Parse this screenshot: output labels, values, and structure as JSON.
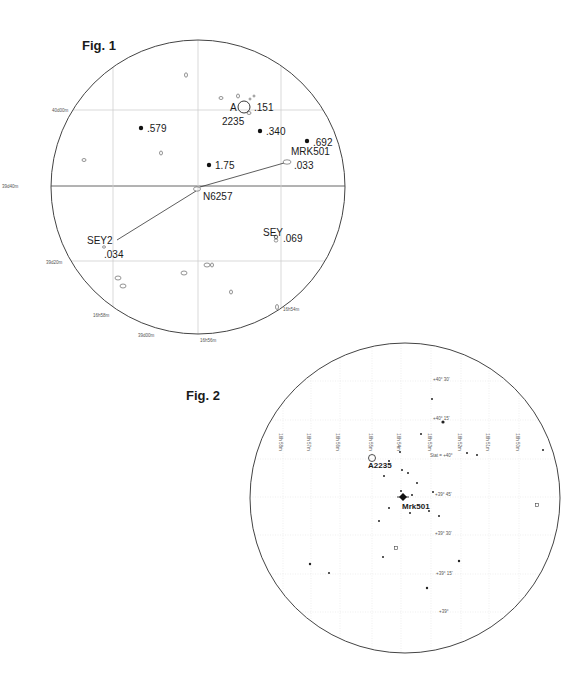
{
  "fig1": {
    "title": "Fig. 1",
    "circle": {
      "cx": 198,
      "cy": 187,
      "r": 147
    },
    "grid_h": [
      {
        "y": 110,
        "label": "40d00m",
        "lx": 52,
        "ly": 112
      },
      {
        "y": 186,
        "label": "39d40m",
        "lx": 2,
        "ly": 188
      },
      {
        "y": 261,
        "label": "39d20m",
        "lx": 46,
        "ly": 264
      }
    ],
    "grid_v": [
      {
        "x": 113,
        "label": "16h58m",
        "lx": 93,
        "ly": 317
      },
      {
        "x": 198,
        "label": "16h56m",
        "lx": 200,
        "ly": 342
      },
      {
        "x": 281,
        "label": "16h54m",
        "lx": 283,
        "ly": 311
      }
    ],
    "extra_axis_labels": [
      {
        "label": "39d00m",
        "x": 138,
        "y": 337
      }
    ],
    "filled_points": [
      {
        "x": 141,
        "y": 128,
        "label": ".579",
        "lx": 147,
        "ly": 132
      },
      {
        "x": 260,
        "y": 131,
        "label": ".340",
        "lx": 266,
        "ly": 135
      },
      {
        "x": 307,
        "y": 141,
        "label": ".692",
        "lx": 313,
        "ly": 146
      },
      {
        "x": 209,
        "y": 165,
        "label": "1.75",
        "lx": 215,
        "ly": 169
      }
    ],
    "open_objects": [
      {
        "x": 186,
        "y": 75,
        "rx": 1.5,
        "ry": 2.2
      },
      {
        "x": 221,
        "y": 98,
        "rx": 2,
        "ry": 1.5
      },
      {
        "x": 238,
        "y": 96,
        "rx": 1.5,
        "ry": 2
      },
      {
        "x": 250,
        "y": 99,
        "rx": 1,
        "ry": 1
      },
      {
        "x": 254,
        "y": 96,
        "rx": 1,
        "ry": 1
      },
      {
        "x": 249,
        "y": 113,
        "rx": 2,
        "ry": 1.5
      },
      {
        "x": 84,
        "y": 160,
        "rx": 2,
        "ry": 1.5
      },
      {
        "x": 161,
        "y": 153,
        "rx": 1.5,
        "ry": 2
      },
      {
        "x": 197,
        "y": 189,
        "rx": 3.5,
        "ry": 2.2
      },
      {
        "x": 287,
        "y": 162,
        "rx": 4,
        "ry": 2.2
      },
      {
        "x": 104,
        "y": 247,
        "rx": 1.5,
        "ry": 1.2
      },
      {
        "x": 276,
        "y": 237,
        "rx": 1.5,
        "ry": 2
      },
      {
        "x": 118,
        "y": 278,
        "rx": 3,
        "ry": 2
      },
      {
        "x": 123,
        "y": 286,
        "rx": 3,
        "ry": 2
      },
      {
        "x": 184,
        "y": 273,
        "rx": 3,
        "ry": 2
      },
      {
        "x": 207,
        "y": 265,
        "rx": 3,
        "ry": 2
      },
      {
        "x": 212,
        "y": 265,
        "rx": 1.5,
        "ry": 2
      },
      {
        "x": 231,
        "y": 292,
        "rx": 1.5,
        "ry": 2
      },
      {
        "x": 277,
        "y": 307,
        "rx": 1.5,
        "ry": 2.5
      }
    ],
    "cluster": {
      "x": 244,
      "y": 107,
      "r": 6,
      "label_top": "A",
      "label_bottom": "2235",
      "z": ".151"
    },
    "labels": [
      {
        "text": "A",
        "x": 230,
        "y": 111,
        "size": 10
      },
      {
        "text": "2235",
        "x": 222,
        "y": 125,
        "size": 10
      },
      {
        "text": ".151",
        "x": 254,
        "y": 111,
        "size": 10
      },
      {
        "text": "MRK501",
        "x": 291,
        "y": 155,
        "size": 10
      },
      {
        "text": ".033",
        "x": 294,
        "y": 169,
        "size": 10
      },
      {
        "text": "N6257",
        "x": 203,
        "y": 200,
        "size": 10
      },
      {
        "text": "SEY2",
        "x": 87,
        "y": 244,
        "size": 10
      },
      {
        "text": ".034",
        "x": 104,
        "y": 258,
        "size": 10
      },
      {
        "text": "SEY",
        "x": 263,
        "y": 236,
        "size": 10
      },
      {
        "text": ".069",
        "x": 283,
        "y": 242,
        "size": 10
      }
    ],
    "sey_marker": {
      "x": 276,
      "y": 239
    },
    "lines": [
      {
        "x1": 200,
        "y1": 187,
        "x2": 284,
        "y2": 163
      },
      {
        "x1": 196,
        "y1": 191,
        "x2": 117,
        "y2": 240
      }
    ]
  },
  "fig2": {
    "title": "Fig. 2",
    "circle": {
      "cx": 405,
      "cy": 498,
      "r": 155
    },
    "ra_labels": [
      {
        "text": "16h 58m",
        "x": 279
      },
      {
        "text": "16h 57m",
        "x": 307
      },
      {
        "text": "16h 56m",
        "x": 336
      },
      {
        "text": "16h 55m",
        "x": 369
      },
      {
        "text": "16h 54m",
        "x": 397
      },
      {
        "text": "16h 53m",
        "x": 428
      },
      {
        "text": "16h 52m",
        "x": 458
      },
      {
        "text": "16h 51m",
        "x": 486
      },
      {
        "text": "16h 50m",
        "x": 516
      }
    ],
    "ra_label_y": 442,
    "dec_labels": [
      {
        "text": "+40° 30'",
        "x": 433,
        "y": 381
      },
      {
        "text": "+40° 15'",
        "x": 433,
        "y": 420
      },
      {
        "text": "Stat = +40°",
        "x": 430,
        "y": 457
      },
      {
        "text": "+39° 45'",
        "x": 435,
        "y": 496
      },
      {
        "text": "+39° 30'",
        "x": 435,
        "y": 535
      },
      {
        "text": "+39° 15'",
        "x": 436,
        "y": 575
      },
      {
        "text": "+39°",
        "x": 439,
        "y": 613
      }
    ],
    "grid_h_y": [
      381,
      420,
      459,
      497,
      535,
      574,
      612
    ],
    "grid_v_x": [
      283,
      311,
      340,
      372,
      401,
      431,
      461,
      489,
      519
    ],
    "stars": [
      {
        "x": 432,
        "y": 399,
        "s": 1
      },
      {
        "x": 443,
        "y": 422,
        "s": 1.6
      },
      {
        "x": 421,
        "y": 434,
        "s": 1
      },
      {
        "x": 400,
        "y": 452,
        "s": 1
      },
      {
        "x": 467,
        "y": 453,
        "s": 1
      },
      {
        "x": 477,
        "y": 455,
        "s": 1
      },
      {
        "x": 389,
        "y": 461,
        "s": 1
      },
      {
        "x": 402,
        "y": 470,
        "s": 1
      },
      {
        "x": 408,
        "y": 473,
        "s": 1
      },
      {
        "x": 384,
        "y": 476,
        "s": 1
      },
      {
        "x": 417,
        "y": 483,
        "s": 1
      },
      {
        "x": 401,
        "y": 491,
        "s": 1
      },
      {
        "x": 412,
        "y": 495,
        "s": 1
      },
      {
        "x": 433,
        "y": 492,
        "s": 1
      },
      {
        "x": 389,
        "y": 508,
        "s": 1
      },
      {
        "x": 410,
        "y": 513,
        "s": 1
      },
      {
        "x": 429,
        "y": 511,
        "s": 1
      },
      {
        "x": 439,
        "y": 516,
        "s": 1
      },
      {
        "x": 379,
        "y": 521,
        "s": 1
      },
      {
        "x": 383,
        "y": 557,
        "s": 1
      },
      {
        "x": 459,
        "y": 561,
        "s": 1.2
      },
      {
        "x": 310,
        "y": 564,
        "s": 1.2
      },
      {
        "x": 329,
        "y": 573,
        "s": 1
      },
      {
        "x": 427,
        "y": 588,
        "s": 1.2
      },
      {
        "x": 543,
        "y": 450,
        "s": 1
      }
    ],
    "open_squares": [
      {
        "x": 396,
        "y": 548
      },
      {
        "x": 537,
        "y": 505
      }
    ],
    "a2235": {
      "x": 372,
      "y": 458,
      "r": 3.5,
      "label": "A2235",
      "lx": 368,
      "ly": 468
    },
    "mrk501": {
      "x": 403,
      "y": 497,
      "label": "Mrk501",
      "lx": 402,
      "ly": 509
    }
  }
}
